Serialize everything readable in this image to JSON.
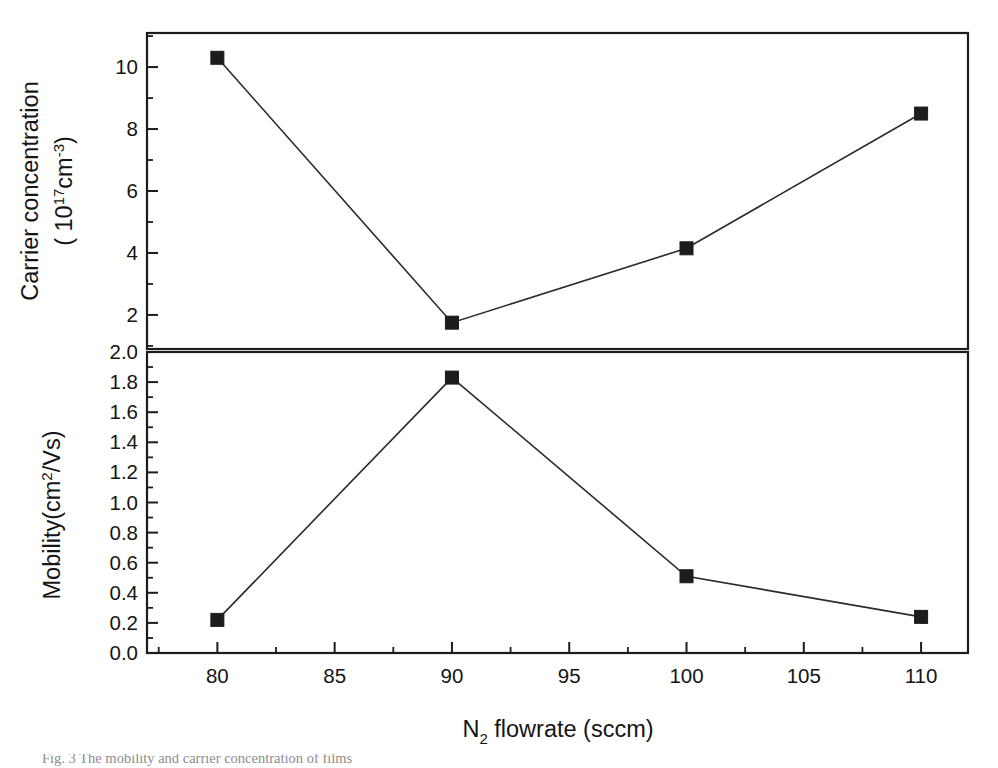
{
  "figure": {
    "background_color": "#ffffff",
    "line_color": "#2a2a2a",
    "marker_color": "#1c1c1c",
    "axis_color": "#1c1c1c",
    "caption": "Fig. 3   The mobility and carrier concentration of films"
  },
  "xaxis": {
    "label_main": "N",
    "label_sub": "2",
    "label_rest": " flowrate (sccm)",
    "label_full": "N2 flowrate (sccm)",
    "ticks": [
      "80",
      "85",
      "90",
      "95",
      "100",
      "105",
      "110"
    ],
    "tickvalues": [
      80,
      85,
      90,
      95,
      100,
      105,
      110
    ],
    "min": 77,
    "max": 112,
    "minor_step": 2.5
  },
  "top_panel": {
    "ylabel_line1": "Carrier concentration",
    "ylabel_line2_pre": "( 10",
    "ylabel_line2_sup": "17",
    "ylabel_line2_mid": "cm",
    "ylabel_line2_sup2": "-3",
    "ylabel_line2_post": ")",
    "ylabel_full": "Carrier concentration ( 10^17 cm^-3 )",
    "ticks": [
      "2",
      "4",
      "6",
      "8",
      "10"
    ],
    "tickvalues": [
      2,
      4,
      6,
      8,
      10
    ],
    "min": 0.9,
    "max": 11.1,
    "minor_step": 1
  },
  "bottom_panel": {
    "ylabel_pre": "Mobility(cm",
    "ylabel_sup": "2",
    "ylabel_post": "/Vs)",
    "ylabel_full": "Mobility(cm^2/Vs)",
    "ticks": [
      "0.0",
      "0.2",
      "0.4",
      "0.6",
      "0.8",
      "1.0",
      "1.2",
      "1.4",
      "1.6",
      "1.8",
      "2.0"
    ],
    "tickvalues": [
      0.0,
      0.2,
      0.4,
      0.6,
      0.8,
      1.0,
      1.2,
      1.4,
      1.6,
      1.8,
      2.0
    ],
    "min": 0.0,
    "max": 2.0,
    "minor_step": 0.1
  },
  "chart_data": [
    {
      "type": "line",
      "panel": "top",
      "title": "Carrier concentration vs N2 flowrate",
      "xlabel": "N2 flowrate (sccm)",
      "ylabel": "Carrier concentration ( 10^17 cm^-3 )",
      "x": [
        80,
        90,
        100,
        110
      ],
      "values": [
        10.3,
        1.75,
        4.15,
        8.5
      ],
      "xlim": [
        77,
        112
      ],
      "ylim": [
        0.9,
        11.1
      ],
      "grid": false,
      "legend": "none",
      "marker": "filled-square",
      "series": [
        {
          "name": "Carrier concentration",
          "values": [
            10.3,
            1.75,
            4.15,
            8.5
          ]
        }
      ]
    },
    {
      "type": "line",
      "panel": "bottom",
      "title": "Mobility vs N2 flowrate",
      "xlabel": "N2 flowrate (sccm)",
      "ylabel": "Mobility(cm^2/Vs)",
      "x": [
        80,
        90,
        100,
        110
      ],
      "values": [
        0.22,
        1.83,
        0.51,
        0.24
      ],
      "xlim": [
        77,
        112
      ],
      "ylim": [
        0.0,
        2.0
      ],
      "grid": false,
      "legend": "none",
      "marker": "filled-square",
      "series": [
        {
          "name": "Mobility",
          "values": [
            0.22,
            1.83,
            0.51,
            0.24
          ]
        }
      ]
    }
  ]
}
